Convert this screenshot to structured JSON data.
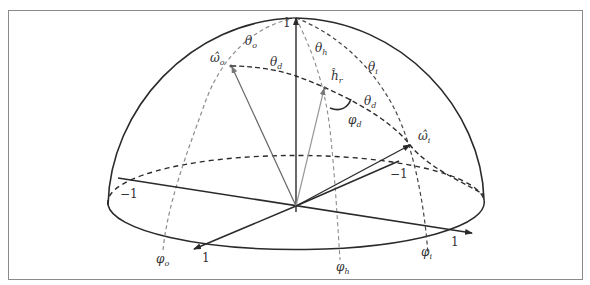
{
  "figure": {
    "colors": {
      "outline": "#2a2a2a",
      "dashed_light": "#8c8c8c",
      "dashed_dark": "#2a2a2a",
      "vector_gray": "#7a7a7a",
      "frame": "#8a8a8a"
    },
    "labels": {
      "omega_o": {
        "base": "ω̂",
        "sub": "o"
      },
      "omega_i": {
        "base": "ω̂",
        "sub": "i"
      },
      "h_r": {
        "base": "ĥ",
        "sub": "r"
      },
      "theta_o": {
        "base": "θ",
        "sub": "o"
      },
      "theta_h": {
        "base": "θ",
        "sub": "h"
      },
      "theta_i": {
        "base": "θ",
        "sub": "i"
      },
      "theta_d_top": {
        "base": "θ",
        "sub": "d"
      },
      "theta_d_right": {
        "base": "θ",
        "sub": "d"
      },
      "phi_d": {
        "base": "φ",
        "sub": "d"
      },
      "phi_o": {
        "base": "φ",
        "sub": "o"
      },
      "phi_h": {
        "base": "φ",
        "sub": "h"
      },
      "phi_i": {
        "base": "φ",
        "sub": "i"
      }
    },
    "axis_ticks": {
      "z_top": "1",
      "x_left": "−1",
      "x_right": "1",
      "y_front": "1",
      "y_back": "−1"
    }
  }
}
